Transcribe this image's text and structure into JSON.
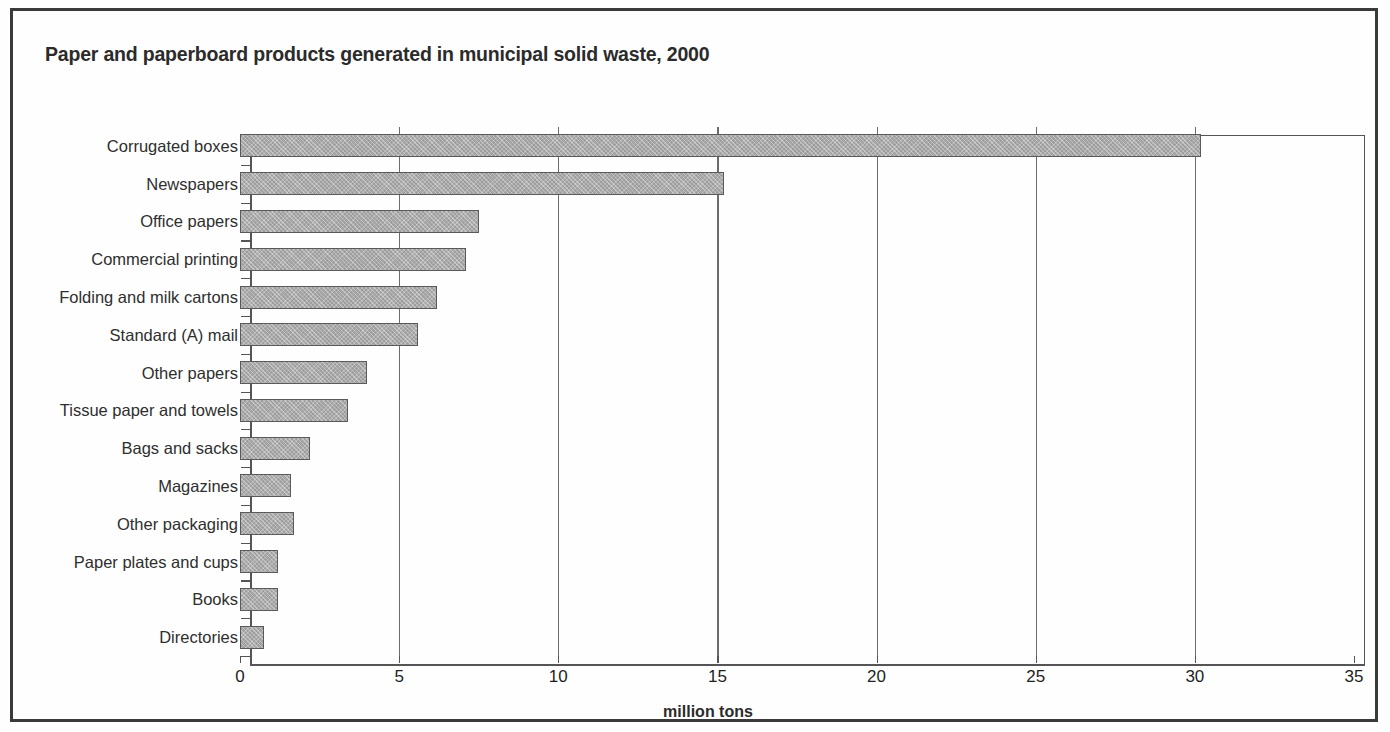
{
  "chart_data": {
    "type": "bar",
    "orientation": "horizontal",
    "title": "Paper and paperboard products generated in municipal solid waste, 2000",
    "xlabel": "million tons",
    "ylabel": "",
    "xlim": [
      0,
      35
    ],
    "xticks": [
      0,
      5,
      10,
      15,
      20,
      25,
      30,
      35
    ],
    "xtick_labels": [
      "0",
      "5",
      "10",
      "15",
      "20",
      "25",
      "30",
      "35"
    ],
    "grid": "vertical",
    "legend": "none",
    "bar_color": "#9e9e9e",
    "bar_edge_color": "#5a5a5a",
    "categories": [
      "Corrugated boxes",
      "Newspapers",
      "Office papers",
      "Commercial printing",
      "Folding and milk cartons",
      "Standard (A) mail",
      "Other papers",
      "Tissue paper and towels",
      "Bags and sacks",
      "Magazines",
      "Other packaging",
      "Paper plates and cups",
      "Books",
      "Directories"
    ],
    "values": [
      30.2,
      15.2,
      7.5,
      7.1,
      6.2,
      5.6,
      4.0,
      3.4,
      2.2,
      1.6,
      1.7,
      1.2,
      1.2,
      0.75
    ]
  },
  "figure": {
    "border_color": "#3a3a3a",
    "background": "#fefefe",
    "axis_color": "#555555",
    "text_color": "#2b2b2b"
  }
}
